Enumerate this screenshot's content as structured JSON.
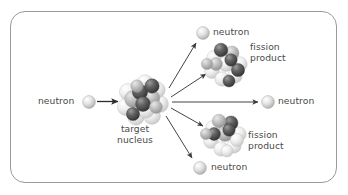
{
  "figure": {
    "name": "nuclear-fission-diagram",
    "frame": {
      "border_color": "#9a9a9a",
      "background": "#ffffff",
      "corner_radius": 15
    },
    "text_color": "#4a4a4a",
    "labels": {
      "incoming_neutron": "neutron",
      "target_nucleus_line1": "target",
      "target_nucleus_line2": "nucleus",
      "fission_product_top_line1": "fission",
      "fission_product_top_line2": "product",
      "fission_product_bottom_line1": "fission",
      "fission_product_bottom_line2": "product",
      "neutron_top": "neutron",
      "neutron_middle": "neutron",
      "neutron_bottom": "neutron"
    },
    "particles": {
      "neutron_color_light": "#f2f2f2",
      "neutron_color_mid": "#c9c9c9",
      "neutron_color_dark": "#9c9c9c",
      "nucleon_dark": "#4d4d4d",
      "nucleon_mid": "#b5b5b5",
      "nucleon_light": "#f0f0f0"
    },
    "arrows": {
      "color": "#3a3a3a",
      "count": 5,
      "directions": [
        "incoming-right",
        "up-right",
        "up-right-short",
        "right",
        "down-right-short",
        "down-right"
      ]
    }
  }
}
